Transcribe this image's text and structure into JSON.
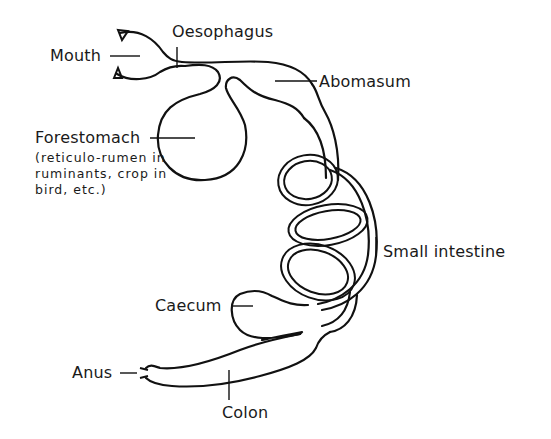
{
  "diagram": {
    "type": "anatomical-line-drawing",
    "labels": {
      "mouth": "Mouth",
      "oesophagus": "Oesophagus",
      "abomasum": "Abomasum",
      "forestomach": "Forestomach",
      "forestomach_note": "(reticulo-rumen in ruminants, crop in bird, etc.)",
      "forestomach_note_lines": [
        "(reticulo-rumen in",
        "ruminants, crop in",
        "bird, etc.)"
      ],
      "small_intestine": "Small intestine",
      "caecum": "Caecum",
      "anus": "Anus",
      "colon": "Colon"
    },
    "colors": {
      "background": "#ffffff",
      "line": "#111111"
    }
  }
}
